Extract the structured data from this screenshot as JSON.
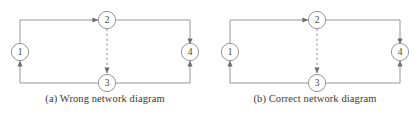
{
  "figure": {
    "background_color": "#ffffff",
    "line_color": "#7d7d7d",
    "text_color": "#3a3a3a",
    "panels": [
      {
        "id": "a",
        "caption": "(a) Wrong network diagram",
        "nodes": [
          {
            "id": "n1",
            "label": "1",
            "cx": 20,
            "cy": 52
          },
          {
            "id": "n2",
            "label": "2",
            "cx": 107,
            "cy": 20
          },
          {
            "id": "n3",
            "label": "3",
            "cx": 107,
            "cy": 83
          },
          {
            "id": "n4",
            "label": "4",
            "cx": 190,
            "cy": 52
          }
        ],
        "edges": [
          {
            "id": "e12",
            "from": "1",
            "to": "2",
            "style": "solid",
            "arrow": "to-node-2"
          },
          {
            "id": "e24",
            "from": "2",
            "to": "4",
            "style": "solid",
            "arrow": "to-node-4-top"
          },
          {
            "id": "e13",
            "from": "1",
            "to": "3",
            "style": "solid",
            "arrow": "to-node-1"
          },
          {
            "id": "e34",
            "from": "3",
            "to": "4",
            "style": "solid",
            "arrow": "to-node-4-bottom"
          },
          {
            "id": "e23",
            "from": "2",
            "to": "3",
            "style": "dashed",
            "arrow": "to-node-3"
          }
        ]
      },
      {
        "id": "b",
        "caption": "(b) Correct network diagram",
        "nodes": [
          {
            "id": "n1",
            "label": "1",
            "cx": 20,
            "cy": 52
          },
          {
            "id": "n2",
            "label": "2",
            "cx": 107,
            "cy": 20
          },
          {
            "id": "n3",
            "label": "3",
            "cx": 107,
            "cy": 83
          },
          {
            "id": "n4",
            "label": "4",
            "cx": 190,
            "cy": 52
          }
        ],
        "edges": [
          {
            "id": "e12",
            "from": "1",
            "to": "2",
            "style": "solid",
            "arrow": "to-node-2"
          },
          {
            "id": "e24",
            "from": "2",
            "to": "4",
            "style": "solid",
            "arrow": "to-node-4-top"
          },
          {
            "id": "e13",
            "from": "1",
            "to": "3",
            "style": "solid",
            "arrow": "to-node-1"
          },
          {
            "id": "e34",
            "from": "3",
            "to": "4",
            "style": "solid",
            "arrow": "to-node-4-bottom"
          },
          {
            "id": "e23",
            "from": "2",
            "to": "3",
            "style": "dashed",
            "arrow": "to-node-3"
          }
        ]
      }
    ]
  }
}
